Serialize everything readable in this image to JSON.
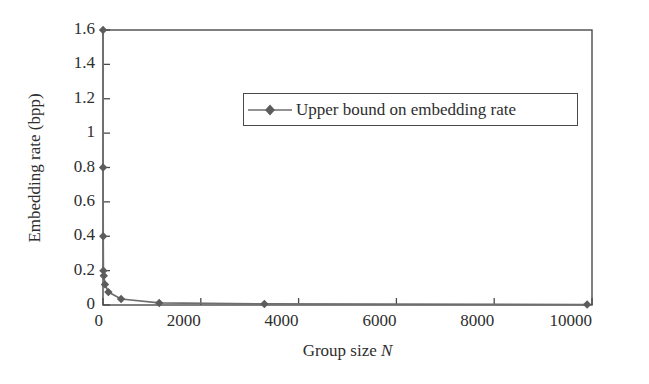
{
  "chart_data": {
    "type": "line",
    "title": "",
    "subtitle": "",
    "xlabel_prefix": "Group size ",
    "xlabel_symbol": "N",
    "ylabel": "Embedding rate (bpp)",
    "xlim": [
      0,
      10000
    ],
    "ylim": [
      0,
      1.6
    ],
    "grid": false,
    "legend_position": "upper-center",
    "x_ticks": [
      0,
      2000,
      4000,
      6000,
      8000,
      10000
    ],
    "x_tick_labels": [
      "0",
      "2000",
      "4000",
      "6000",
      "8000",
      "10000"
    ],
    "y_ticks": [
      0,
      0.2,
      0.4,
      0.6,
      0.8,
      1.0,
      1.2,
      1.4,
      1.6
    ],
    "y_tick_labels": [
      "0",
      "0.2",
      "0.4",
      "0.6",
      "0.8",
      "1",
      "1.2",
      "1.4",
      "1.6"
    ],
    "series": [
      {
        "name": "Upper bound on embedding rate",
        "marker": "diamond",
        "color": "#6e6e6e",
        "x": [
          1,
          2,
          4,
          8,
          16,
          40,
          110,
          370,
          1150,
          3300,
          9900
        ],
        "y": [
          1.6,
          0.8,
          0.4,
          0.2,
          0.17,
          0.12,
          0.075,
          0.035,
          0.012,
          0.006,
          0.003
        ]
      }
    ]
  },
  "legend": {
    "entries": [
      {
        "label": "Upper bound on embedding rate",
        "marker": "diamond",
        "color": "#6e6e6e"
      }
    ]
  },
  "colors": {
    "axis": "#4a4a4a",
    "series": "#6e6e6e",
    "text": "#2e2e2e",
    "background": "#ffffff"
  }
}
